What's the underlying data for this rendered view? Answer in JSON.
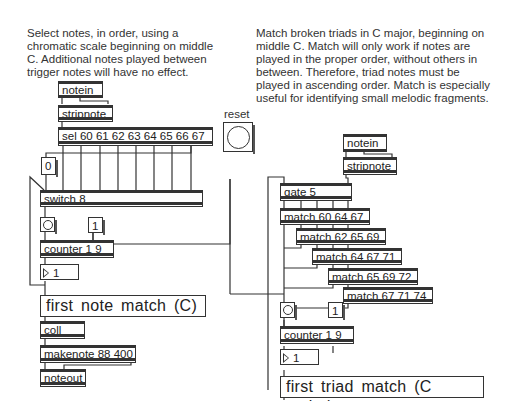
{
  "comments": {
    "left": "Select notes, in order, using a\nchromatic scale beginning on middle\nC. Additional notes played between\ntrigger notes will have no effect.",
    "right": "Match broken triads in C major, beginning on\nmiddle C. Match will only work if notes are\nplayed in the proper order, without others in\nbetween. Therefore, triad notes must be\nplayed in ascending order. Match is especially\nuseful for identifying small melodic fragments."
  },
  "left_patch": {
    "notein": "notein",
    "stripnote": "stripnote",
    "sel": "sel 60 61 62 63 64 65 66 67",
    "msg_zero": "0",
    "switch": "switch 8",
    "msg_one": "1",
    "counter": "counter 1 9",
    "number_value": "1",
    "label": "first note match (C)",
    "coll": "coll",
    "makenote": "makenote 88 400",
    "noteout": "noteout"
  },
  "reset": {
    "label": "reset"
  },
  "right_patch": {
    "notein": "notein",
    "stripnote": "stripnote",
    "gate": "gate 5",
    "matches": [
      "match 60 64 67",
      "match 62 65 69",
      "match 64 67 71",
      "match 65 69 72",
      "match 67 71 74"
    ],
    "msg_one": "1",
    "counter": "counter 1 9",
    "number_value": "1",
    "label": "first triad match (C major)"
  }
}
